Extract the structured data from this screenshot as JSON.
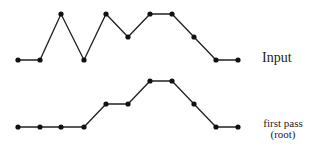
{
  "labels": {
    "input": "Input",
    "first_pass_line1": "first pass",
    "first_pass_line2": "(root)"
  },
  "chart_data": {
    "type": "line",
    "title": "",
    "series": [
      {
        "name": "Input",
        "x": [
          1,
          2,
          3,
          4,
          5,
          6,
          7,
          8,
          9,
          10,
          11
        ],
        "values": [
          0,
          0,
          2,
          0,
          2,
          1,
          2,
          2,
          1,
          0,
          0
        ]
      },
      {
        "name": "first pass (root)",
        "x": [
          1,
          2,
          3,
          4,
          5,
          6,
          7,
          8,
          9,
          10,
          11
        ],
        "values": [
          0,
          0,
          0,
          0,
          1,
          1,
          2,
          2,
          1,
          0,
          0
        ]
      }
    ],
    "grid": false,
    "axes": "none"
  },
  "colors": {
    "line": "#222222",
    "point": "#111111"
  }
}
